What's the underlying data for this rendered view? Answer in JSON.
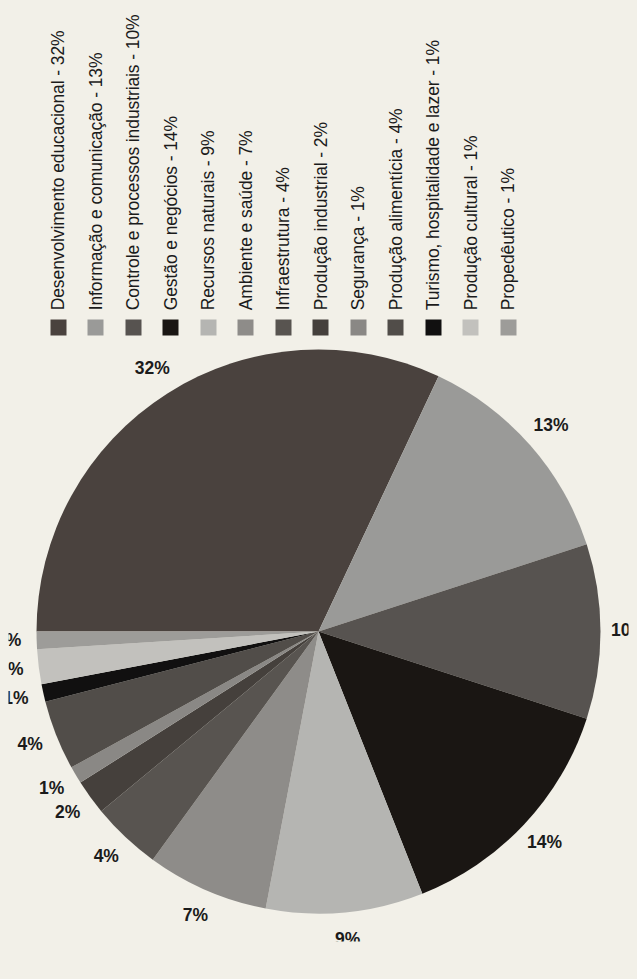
{
  "background_color": "#f2f0e8",
  "rotation_note": "figure printed rotated 90 degrees counter-clockwise",
  "legend": {
    "entries": [
      {
        "label": "Desenvolvimento educacional - 32%",
        "color": "#4a423e",
        "clipped": true
      },
      {
        "label": "Informação e comunicação - 13%",
        "color": "#9a9a98",
        "clipped": true
      },
      {
        "label": "Controle e processos industriais - 10%",
        "color": "#575350",
        "clipped": true
      },
      {
        "label": "Gestão e negócios - 14%",
        "color": "#1a1613",
        "clipped": false
      },
      {
        "label": "Recursos naturais - 9%",
        "color": "#b5b5b2",
        "clipped": false
      },
      {
        "label": "Ambiente e saúde - 7%",
        "color": "#8e8c89",
        "clipped": false
      },
      {
        "label": "Infraestrutura - 4%",
        "color": "#585450",
        "clipped": false
      },
      {
        "label": "Produção industrial - 2%",
        "color": "#45403c",
        "clipped": false
      },
      {
        "label": "Segurança - 1%",
        "color": "#8a8885",
        "clipped": false
      },
      {
        "label": "Produção alimentícia - 4%",
        "color": "#514d49",
        "clipped": false
      },
      {
        "label": "Turismo, hospitalidade e lazer - 1%",
        "color": "#111010",
        "clipped": true
      },
      {
        "label": "Produção cultural - 1%",
        "color": "#c2c1bd",
        "clipped": false
      },
      {
        "label": "Propedêutico - 1%",
        "color": "#9d9c99",
        "clipped": false
      }
    ]
  },
  "chart_data": {
    "type": "pie",
    "title": "",
    "legend_position": "right",
    "labels": [
      "Desenvolvimento educacional",
      "Informação e comunicação",
      "Controle e processos industriais",
      "Gestão e negócios",
      "Recursos naturais",
      "Ambiente e saúde",
      "Infraestrutura",
      "Produção industrial",
      "Segurança",
      "Produção alimentícia",
      "Turismo, hospitalidade e lazer",
      "Produção cultural",
      "Propedêutico"
    ],
    "values": [
      32,
      13,
      10,
      14,
      9,
      7,
      4,
      2,
      1,
      4,
      1,
      2,
      1
    ],
    "value_labels": [
      "32%",
      "13%",
      "10%",
      "14%",
      "9%",
      "7%",
      "4%",
      "2%",
      "1%",
      "4%",
      "1%",
      "2%",
      "1%"
    ],
    "colors": [
      "#4a423e",
      "#9a9a98",
      "#575350",
      "#1a1613",
      "#b5b5b2",
      "#8e8c89",
      "#585450",
      "#45403c",
      "#8a8885",
      "#514d49",
      "#111010",
      "#c2c1bd",
      "#9d9c99"
    ],
    "units": "percent",
    "total": 101,
    "start_angle_deg": -90,
    "direction": "clockwise"
  }
}
